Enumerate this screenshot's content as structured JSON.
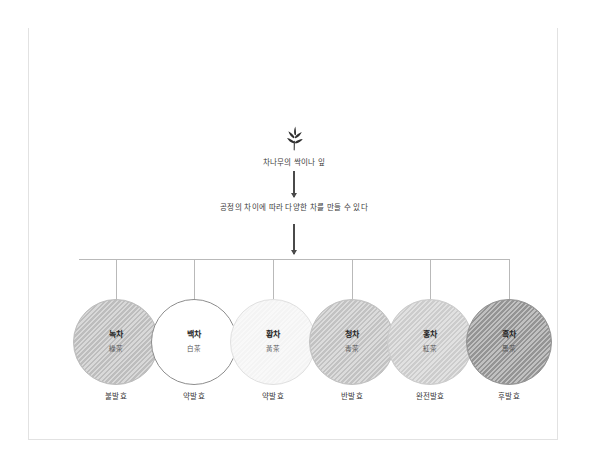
{
  "figure": {
    "badge": "그림 1",
    "title": "6대 차의 분류"
  },
  "flow": {
    "source_icon": "sprout-icon",
    "source_label": "차나무의 싹이나 잎",
    "process_label": "공정의 차이에 따라 다양한 차를 만들 수 있다",
    "arrow_icon": "down-arrow-icon"
  },
  "teas": [
    {
      "name_ko": "녹차",
      "name_hanja": "綠茶",
      "fermentation": "불발효",
      "fill": "#bdbdbd",
      "stroke": "#bdbdbd",
      "cx": 87
    },
    {
      "name_ko": "백차",
      "name_hanja": "白茶",
      "fermentation": "약발효",
      "fill": "#ffffff",
      "stroke": "#8c8c8c",
      "cx": 165
    },
    {
      "name_ko": "황차",
      "name_hanja": "黃茶",
      "fermentation": "약발효",
      "fill": "#f4f4f4",
      "stroke": "#e0e0e0",
      "cx": 244
    },
    {
      "name_ko": "청차",
      "name_hanja": "靑茶",
      "fermentation": "반발효",
      "fill": "#c2c2c2",
      "stroke": "#c2c2c2",
      "cx": 323
    },
    {
      "name_ko": "홍차",
      "name_hanja": "紅茶",
      "fermentation": "완전발효",
      "fill": "#cccccc",
      "stroke": "#cccccc",
      "cx": 401
    },
    {
      "name_ko": "흑차",
      "name_hanja": "黑茶",
      "fermentation": "후발효",
      "fill": "#949494",
      "stroke": "#949494",
      "cx": 480
    }
  ],
  "colors": {
    "header_bg": "#d6d6d6",
    "badge_bg": "#7b7b7b",
    "line": "#b9b9b9",
    "arrow": "#4a4a4a",
    "text": "#3a3a3a",
    "page_border": "#e2e2e2"
  }
}
